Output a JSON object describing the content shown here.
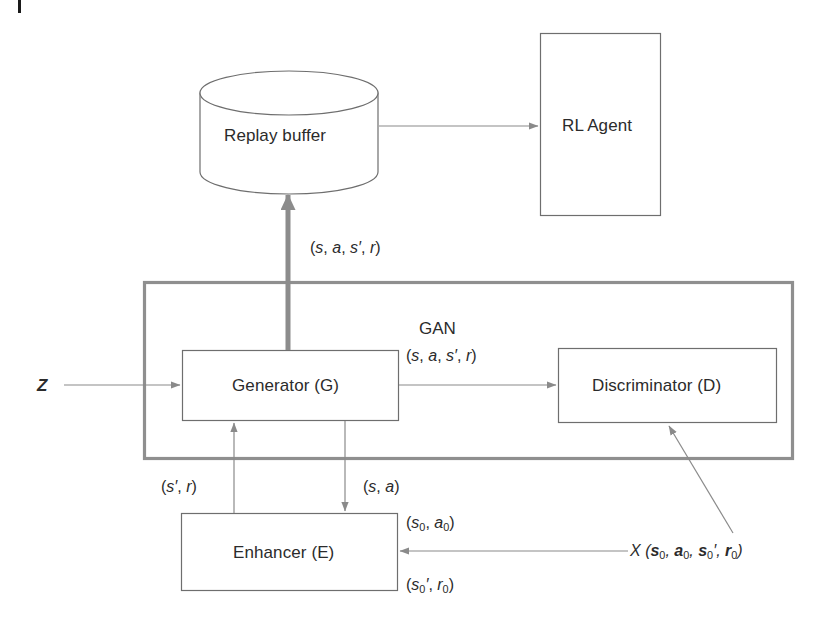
{
  "figure": {
    "type": "block-diagram"
  },
  "nodes": {
    "replay_buffer": {
      "label": "Replay buffer",
      "shape": "cylinder"
    },
    "rl_agent": {
      "label": "RL Agent",
      "shape": "rectangle"
    },
    "generator": {
      "label": "Generator (G)",
      "shape": "rectangle"
    },
    "discriminator": {
      "label": "Discriminator (D)",
      "shape": "rectangle"
    },
    "enhancer": {
      "label": "Enhancer (E)",
      "shape": "rectangle"
    },
    "gan_group": {
      "label": "GAN",
      "shape": "group-rectangle"
    }
  },
  "edge_labels": {
    "buffer_input": "(s, a, s′, r)",
    "gan_title": "GAN",
    "gan_pair": "(s, a, s′, r)",
    "enhancer_to_generator": "(s′, r)",
    "generator_to_enhancer": "(s, a)",
    "enhancer_in_top": "(s₀, a₀)",
    "enhancer_in_bottom": "(s₀′, r₀)",
    "dataset": "X (s₀, a₀, s₀′, r₀)",
    "noise_input": "Z"
  },
  "colors": {
    "stroke_thin": "#8a8a8a",
    "stroke_box": "#6e6e6e",
    "stroke_thick": "#8c8c8c",
    "group_border": "#8f8f8f",
    "text": "#2b2b2b",
    "background": "#ffffff",
    "corner_tick": "#1a1a1a"
  }
}
